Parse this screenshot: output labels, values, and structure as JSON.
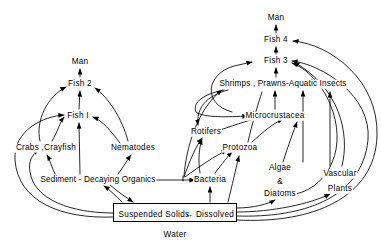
{
  "diagram": {
    "caption": "Water",
    "stroke_color": "#000000",
    "background_color": "#ffffff",
    "water_box": {
      "left_label": "Suspended Solids",
      "exchange_arrow": "↔",
      "right_label": "Dissolved"
    },
    "nodes": [
      {
        "id": "man_left",
        "label": "Man",
        "x": 80,
        "y": 62
      },
      {
        "id": "fish2",
        "label": "Fish 2",
        "x": 80,
        "y": 84
      },
      {
        "id": "fish1",
        "label": "Fish I",
        "x": 78,
        "y": 116
      },
      {
        "id": "crabs_crayfish",
        "label": "Crabs ,Crayfish",
        "x": 46,
        "y": 148
      },
      {
        "id": "nematodes",
        "label": "Nematodes",
        "x": 133,
        "y": 148
      },
      {
        "id": "sediment",
        "label": "Sediment - Decaying Organics",
        "x": 98,
        "y": 180
      },
      {
        "id": "man_right",
        "label": "Man",
        "x": 276,
        "y": 18
      },
      {
        "id": "fish4",
        "label": "Fish 4",
        "x": 276,
        "y": 40
      },
      {
        "id": "fish3",
        "label": "Fish 3",
        "x": 276,
        "y": 61
      },
      {
        "id": "shrimps",
        "label": "Shrimps , Prawns-Aquatic Insects",
        "x": 283,
        "y": 84
      },
      {
        "id": "microcrustacea",
        "label": "Microcrustacea",
        "x": 275,
        "y": 116
      },
      {
        "id": "rotifers",
        "label": "Rotifers",
        "x": 206,
        "y": 132
      },
      {
        "id": "protozoa",
        "label": "Protozoa",
        "x": 240,
        "y": 148
      },
      {
        "id": "bacteria",
        "label": "Bacteria",
        "x": 210,
        "y": 180
      },
      {
        "id": "algae_line1",
        "label": "Algae",
        "x": 280,
        "y": 168
      },
      {
        "id": "algae_line2",
        "label": "&",
        "x": 280,
        "y": 182
      },
      {
        "id": "algae_line3",
        "label": "Diatoms",
        "x": 280,
        "y": 194
      },
      {
        "id": "vascular_line1",
        "label": "Vascular",
        "x": 340,
        "y": 174
      },
      {
        "id": "vascular_line2",
        "label": "Plants",
        "x": 340,
        "y": 189
      }
    ],
    "edges": [
      {
        "from": "fish2",
        "to": "man_left",
        "kind": "vertical"
      },
      {
        "from": "fish1",
        "to": "fish2",
        "kind": "vertical"
      },
      {
        "from": "sediment",
        "to": "fish1",
        "kind": "vertical"
      },
      {
        "from": "crabs_crayfish",
        "to": "fish2",
        "kind": "curve"
      },
      {
        "from": "crabs_crayfish",
        "to": "fish1",
        "kind": "curve"
      },
      {
        "from": "nematodes",
        "to": "fish2",
        "kind": "curve"
      },
      {
        "from": "nematodes",
        "to": "fish1",
        "kind": "curve"
      },
      {
        "from": "sediment",
        "to": "crabs_crayfish",
        "kind": "curve"
      },
      {
        "from": "sediment",
        "to": "nematodes",
        "kind": "curve"
      },
      {
        "from": "water_box",
        "to": "sediment",
        "kind": "curve"
      },
      {
        "from": "sediment",
        "to": "water_box",
        "kind": "curve"
      },
      {
        "from": "water_box",
        "to": "crabs_crayfish",
        "kind": "long-curve"
      },
      {
        "from": "water_box",
        "to": "fish1",
        "kind": "long-curve"
      },
      {
        "from": "fish3",
        "to": "fish4",
        "kind": "vertical"
      },
      {
        "from": "fish4",
        "to": "man_right",
        "kind": "vertical"
      },
      {
        "from": "shrimps",
        "to": "fish3",
        "kind": "vertical"
      },
      {
        "from": "microcrustacea",
        "to": "shrimps",
        "kind": "vertical"
      },
      {
        "from": "algae",
        "to": "shrimps",
        "kind": "vertical"
      },
      {
        "from": "algae",
        "to": "microcrustacea",
        "kind": "curve"
      },
      {
        "from": "protozoa",
        "to": "microcrustacea",
        "kind": "curve"
      },
      {
        "from": "rotifers",
        "to": "microcrustacea",
        "kind": "curve"
      },
      {
        "from": "bacteria",
        "to": "protozoa",
        "kind": "curve"
      },
      {
        "from": "bacteria",
        "to": "rotifers",
        "kind": "curve"
      },
      {
        "from": "sediment",
        "to": "bacteria",
        "kind": "horizontal"
      },
      {
        "from": "sediment",
        "to": "rotifers",
        "kind": "curve"
      },
      {
        "from": "sediment",
        "to": "protozoa",
        "kind": "curve"
      },
      {
        "from": "water_box",
        "to": "bacteria",
        "kind": "vertical"
      },
      {
        "from": "water_box",
        "to": "protozoa",
        "kind": "curve"
      },
      {
        "from": "water_box",
        "to": "algae",
        "kind": "curve"
      },
      {
        "from": "water_box",
        "to": "vascular",
        "kind": "curve"
      },
      {
        "from": "vascular",
        "to": "fish3",
        "kind": "long-curve"
      },
      {
        "from": "vascular",
        "to": "shrimps",
        "kind": "vertical"
      },
      {
        "from": "algae",
        "to": "fish3",
        "kind": "long-curve"
      },
      {
        "from": "shrimps",
        "to": "rotifers",
        "kind": "curve"
      },
      {
        "from": "shrimps",
        "to": "microcrustacea",
        "kind": "curve"
      },
      {
        "from": "microcrustacea",
        "to": "fish3",
        "kind": "long-curve"
      },
      {
        "from": "water_box",
        "to": "fish3",
        "kind": "long-curve"
      },
      {
        "from": "water_box",
        "to": "fish4",
        "kind": "long-curve"
      }
    ]
  }
}
